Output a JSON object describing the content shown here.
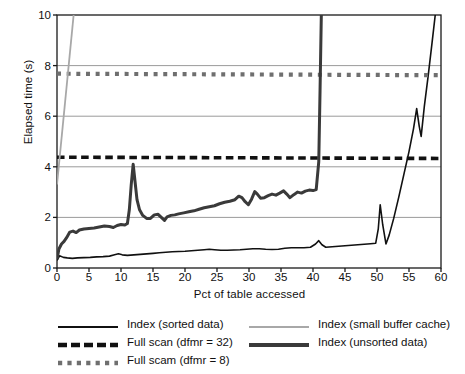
{
  "chart_data": {
    "type": "line",
    "title": "",
    "xlabel": "Pct of table accessed",
    "ylabel": "Elapsed time (s)",
    "xlim": [
      0,
      60
    ],
    "ylim": [
      0,
      10
    ],
    "xticks": [
      0,
      5,
      10,
      15,
      20,
      25,
      30,
      35,
      40,
      45,
      50,
      55,
      60
    ],
    "yticks": [
      0,
      2,
      4,
      6,
      8,
      10
    ],
    "grid": "horizontal",
    "legend_position": "below-plot-two-columns",
    "series": [
      {
        "name": "Index (sorted data)",
        "style": "solid",
        "color": "#111111",
        "width": 1.6,
        "points": [
          [
            0,
            0.3
          ],
          [
            0.4,
            0.48
          ],
          [
            1.0,
            0.42
          ],
          [
            1.6,
            0.4
          ],
          [
            2.4,
            0.38
          ],
          [
            3.2,
            0.4
          ],
          [
            4.2,
            0.41
          ],
          [
            5.2,
            0.42
          ],
          [
            6.2,
            0.44
          ],
          [
            7.2,
            0.45
          ],
          [
            8.2,
            0.47
          ],
          [
            9.0,
            0.52
          ],
          [
            9.6,
            0.56
          ],
          [
            10.2,
            0.52
          ],
          [
            11.0,
            0.5
          ],
          [
            12.0,
            0.52
          ],
          [
            13.0,
            0.54
          ],
          [
            14.0,
            0.56
          ],
          [
            15.0,
            0.58
          ],
          [
            16.0,
            0.6
          ],
          [
            17.0,
            0.62
          ],
          [
            18.0,
            0.64
          ],
          [
            19.0,
            0.65
          ],
          [
            20.0,
            0.66
          ],
          [
            21.0,
            0.68
          ],
          [
            22.0,
            0.7
          ],
          [
            23.0,
            0.72
          ],
          [
            23.8,
            0.74
          ],
          [
            24.6,
            0.72
          ],
          [
            25.6,
            0.7
          ],
          [
            26.6,
            0.7
          ],
          [
            27.6,
            0.71
          ],
          [
            28.6,
            0.72
          ],
          [
            29.6,
            0.74
          ],
          [
            30.6,
            0.76
          ],
          [
            31.6,
            0.76
          ],
          [
            32.6,
            0.74
          ],
          [
            33.6,
            0.73
          ],
          [
            34.6,
            0.74
          ],
          [
            35.6,
            0.78
          ],
          [
            36.6,
            0.8
          ],
          [
            37.6,
            0.8
          ],
          [
            38.6,
            0.8
          ],
          [
            39.6,
            0.82
          ],
          [
            40.4,
            0.95
          ],
          [
            40.9,
            1.08
          ],
          [
            41.4,
            0.92
          ],
          [
            42.0,
            0.82
          ],
          [
            43.0,
            0.84
          ],
          [
            44.0,
            0.86
          ],
          [
            45.0,
            0.88
          ],
          [
            46.0,
            0.9
          ],
          [
            47.0,
            0.92
          ],
          [
            48.0,
            0.94
          ],
          [
            49.0,
            0.96
          ],
          [
            49.8,
            0.98
          ],
          [
            50.2,
            1.55
          ],
          [
            50.5,
            2.5
          ],
          [
            50.9,
            1.7
          ],
          [
            51.4,
            0.95
          ],
          [
            51.9,
            1.3
          ],
          [
            52.6,
            1.95
          ],
          [
            53.4,
            2.8
          ],
          [
            54.2,
            3.7
          ],
          [
            55.0,
            4.6
          ],
          [
            55.7,
            5.5
          ],
          [
            56.2,
            6.3
          ],
          [
            56.6,
            5.6
          ],
          [
            56.9,
            5.2
          ],
          [
            57.4,
            6.4
          ],
          [
            58.0,
            7.6
          ],
          [
            58.6,
            8.9
          ],
          [
            59.1,
            10.0
          ]
        ]
      },
      {
        "name": "Full scan (dfmr = 32)",
        "style": "dashed",
        "color": "#111111",
        "width": 3.6,
        "points": [
          [
            0,
            4.38
          ],
          [
            60,
            4.33
          ]
        ]
      },
      {
        "name": "Full scam (dfmr = 8)",
        "style": "dotted",
        "color": "#6f6f6f",
        "width": 4.2,
        "points": [
          [
            0,
            7.68
          ],
          [
            60,
            7.62
          ]
        ]
      },
      {
        "name": "Index (small buffer cache)",
        "style": "solid",
        "color": "#a8a8a8",
        "width": 1.8,
        "points": [
          [
            0,
            3.3
          ],
          [
            2.6,
            10.0
          ]
        ]
      },
      {
        "name": "Index (unsorted data)",
        "style": "solid",
        "color": "#3a3a3a",
        "width": 3.0,
        "points": [
          [
            0,
            0.35
          ],
          [
            0.3,
            0.75
          ],
          [
            0.7,
            0.95
          ],
          [
            1.1,
            1.05
          ],
          [
            1.5,
            1.2
          ],
          [
            2.0,
            1.42
          ],
          [
            2.5,
            1.46
          ],
          [
            3.0,
            1.4
          ],
          [
            3.5,
            1.5
          ],
          [
            4.2,
            1.54
          ],
          [
            5.0,
            1.56
          ],
          [
            5.8,
            1.58
          ],
          [
            6.6,
            1.62
          ],
          [
            7.4,
            1.66
          ],
          [
            8.2,
            1.64
          ],
          [
            8.8,
            1.6
          ],
          [
            9.4,
            1.68
          ],
          [
            10.0,
            1.72
          ],
          [
            10.6,
            1.7
          ],
          [
            11.0,
            1.76
          ],
          [
            11.3,
            2.3
          ],
          [
            11.6,
            3.3
          ],
          [
            11.9,
            4.1
          ],
          [
            12.2,
            3.4
          ],
          [
            12.5,
            2.7
          ],
          [
            12.9,
            2.3
          ],
          [
            13.4,
            2.08
          ],
          [
            14.0,
            1.96
          ],
          [
            14.6,
            1.96
          ],
          [
            15.2,
            2.1
          ],
          [
            15.8,
            2.12
          ],
          [
            16.3,
            2.0
          ],
          [
            16.8,
            1.88
          ],
          [
            17.2,
            2.02
          ],
          [
            17.8,
            2.08
          ],
          [
            18.4,
            2.1
          ],
          [
            19.0,
            2.14
          ],
          [
            19.8,
            2.18
          ],
          [
            20.6,
            2.22
          ],
          [
            21.4,
            2.26
          ],
          [
            22.2,
            2.32
          ],
          [
            23.0,
            2.38
          ],
          [
            23.8,
            2.42
          ],
          [
            24.6,
            2.46
          ],
          [
            25.4,
            2.54
          ],
          [
            26.2,
            2.6
          ],
          [
            27.0,
            2.64
          ],
          [
            27.8,
            2.7
          ],
          [
            28.4,
            2.84
          ],
          [
            28.9,
            2.78
          ],
          [
            29.4,
            2.62
          ],
          [
            29.9,
            2.5
          ],
          [
            30.4,
            2.72
          ],
          [
            30.9,
            3.02
          ],
          [
            31.3,
            2.92
          ],
          [
            31.8,
            2.76
          ],
          [
            32.4,
            2.78
          ],
          [
            33.0,
            2.86
          ],
          [
            33.6,
            2.92
          ],
          [
            34.2,
            2.88
          ],
          [
            34.8,
            2.96
          ],
          [
            35.4,
            3.05
          ],
          [
            35.9,
            2.92
          ],
          [
            36.4,
            2.78
          ],
          [
            37.0,
            2.9
          ],
          [
            37.6,
            3.0
          ],
          [
            38.2,
            2.96
          ],
          [
            38.8,
            3.04
          ],
          [
            39.4,
            3.08
          ],
          [
            40.0,
            3.06
          ],
          [
            40.5,
            3.1
          ],
          [
            40.9,
            4.2
          ],
          [
            41.1,
            7.0
          ],
          [
            41.3,
            10.0
          ]
        ]
      }
    ]
  },
  "axes": {
    "xlabel": "Pct of table accessed",
    "ylabel": "Elapsed time (s)",
    "xticks": [
      "0",
      "5",
      "10",
      "15",
      "20",
      "25",
      "30",
      "35",
      "40",
      "45",
      "50",
      "55",
      "60"
    ],
    "yticks": [
      "0",
      "2",
      "4",
      "6",
      "8",
      "10"
    ]
  },
  "legend": {
    "left_column": [
      {
        "label": "Index (sorted data)",
        "style": "solid-thin",
        "color": "#111111"
      },
      {
        "label": "Full scan (dfmr = 32)",
        "style": "dashed-thick",
        "color": "#111111"
      },
      {
        "label": "Full scam (dfmr = 8)",
        "style": "dotted-thick",
        "color": "#6f6f6f"
      }
    ],
    "right_column": [
      {
        "label": "Index (small buffer cache)",
        "style": "solid-thin",
        "color": "#a8a8a8"
      },
      {
        "label": "Index (unsorted data)",
        "style": "solid-thick",
        "color": "#3a3a3a"
      }
    ]
  }
}
